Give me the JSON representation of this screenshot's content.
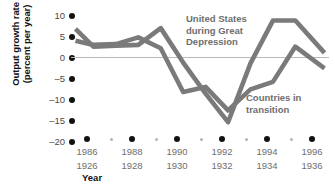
{
  "chart_data": {
    "type": "line",
    "title": "",
    "xlabel": "Year",
    "ylabel_line1": "Output growth rate",
    "ylabel_line2": "(percent per year)",
    "ylim": [
      -20,
      10
    ],
    "yticks": [
      10,
      5,
      0,
      -5,
      -10,
      -15,
      -20
    ],
    "ytick_labels": [
      "10",
      "5",
      "0",
      "–5",
      "–10",
      "–15",
      "–20"
    ],
    "xlim": [
      1985,
      1996.5
    ],
    "xticks_major": [
      1986,
      1988,
      1990,
      1992,
      1994,
      1996
    ],
    "xticks_minor": [
      1987,
      1989,
      1991,
      1993,
      1995
    ],
    "xtick_labels_top": [
      "1986",
      "1988",
      "1990",
      "1992",
      "1994",
      "1996"
    ],
    "xtick_labels_bottom": [
      "1926",
      "1928",
      "1930",
      "1932",
      "1934",
      "1936"
    ],
    "grid": false,
    "legend": "annotations",
    "line_color": "#7a7a7a",
    "zero_line_color": "#b9b9b9",
    "series": [
      {
        "name": "United States during Great Depression",
        "x": [
          1985.2,
          1986.0,
          1987.0,
          1988.0,
          1989.0,
          1990.0,
          1991.0,
          1992.0,
          1993.0,
          1994.0,
          1995.0,
          1996.3
        ],
        "values": [
          6.2,
          2.0,
          2.2,
          2.4,
          6.4,
          -1.8,
          -9.2,
          -16.0,
          -2.0,
          8.2,
          8.2,
          0.5
        ]
      },
      {
        "name": "Countries in transition",
        "x": [
          1985.2,
          1986.0,
          1987.0,
          1988.0,
          1989.0,
          1990.0,
          1991.0,
          1992.0,
          1993.0,
          1994.0,
          1995.0,
          1996.3
        ],
        "values": [
          3.4,
          2.4,
          2.6,
          4.2,
          1.6,
          -8.8,
          -7.6,
          -13.2,
          -8.2,
          -6.4,
          2.0,
          -3.2
        ]
      }
    ],
    "annotations": [
      {
        "id": "us-annotation",
        "line1": "United States",
        "line2": "during Great",
        "line3": "Depression"
      },
      {
        "id": "transition-annotation",
        "line1": "Countries in",
        "line2": "transition"
      }
    ]
  }
}
